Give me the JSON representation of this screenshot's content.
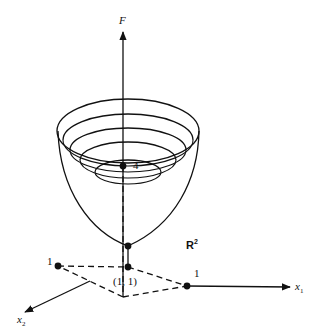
{
  "figure": {
    "type": "3d-surface-diagram",
    "labels": {
      "vertical_axis": "F",
      "x1_axis": "x",
      "x1_sub": "1",
      "x2_axis": "x",
      "x2_sub": "2",
      "plane": "R",
      "plane_sup": "2",
      "f_value": "4",
      "x1_tick": "1",
      "x2_tick": "1",
      "min_point": "(1, 1)"
    },
    "contour_count": 5,
    "colors": {
      "ink": "#111111",
      "background": "#ffffff"
    }
  }
}
